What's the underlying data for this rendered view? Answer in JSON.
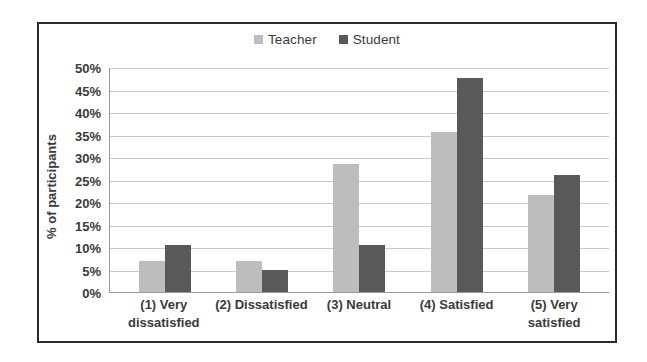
{
  "chart_data": {
    "type": "bar",
    "title": "",
    "xlabel": "",
    "ylabel": "% of participants",
    "ylim": [
      0,
      50
    ],
    "ytick_labels": [
      "50%",
      "45%",
      "40%",
      "35%",
      "30%",
      "25%",
      "20%",
      "15%",
      "10%",
      "5%",
      "0%"
    ],
    "ytick_values": [
      50,
      45,
      40,
      35,
      30,
      25,
      20,
      15,
      10,
      5,
      0
    ],
    "grid": true,
    "legend_position": "top-center",
    "categories": [
      "(1) Very dissatisfied",
      "(2) Dissatisfied",
      "(3) Neutral",
      "(4) Satisfied",
      "(5) Very satisfied"
    ],
    "series": [
      {
        "name": "Teacher",
        "color": "#bdbdbd",
        "values": [
          7,
          7,
          28.5,
          35.5,
          21.5
        ]
      },
      {
        "name": "Student",
        "color": "#595959",
        "values": [
          10.5,
          5,
          10.5,
          47.5,
          26
        ]
      }
    ]
  },
  "legend": {
    "items": [
      {
        "label": "Teacher",
        "color": "#bdbdbd"
      },
      {
        "label": "Student",
        "color": "#595959"
      }
    ]
  },
  "axes": {
    "y_title": "% of participants"
  }
}
